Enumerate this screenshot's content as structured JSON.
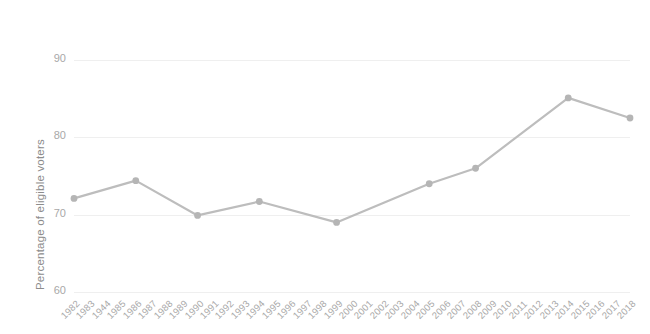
{
  "chart_data": {
    "type": "line",
    "title": "",
    "xlabel": "",
    "ylabel": "Percentage of eligible voters",
    "ylim": [
      60,
      90
    ],
    "yticks": [
      60,
      70,
      80,
      90
    ],
    "grid": true,
    "legend": false,
    "legend_position": "none",
    "line_color": "#bdbdbd",
    "marker_color": "#b5b5b5",
    "grid_color": "#efefef",
    "axis_label_color": "#a8a8a8",
    "categories": [
      "1982",
      "1983",
      "1944",
      "1985",
      "1986",
      "1987",
      "1988",
      "1989",
      "1990",
      "1991",
      "1992",
      "1993",
      "1994",
      "1995",
      "1996",
      "1997",
      "1998",
      "1999",
      "2000",
      "2001",
      "2002",
      "2003",
      "2004",
      "2005",
      "2006",
      "2007",
      "2008",
      "2009",
      "2010",
      "2011",
      "2012",
      "2013",
      "2014",
      "2015",
      "2016",
      "2017",
      "2018"
    ],
    "series": [
      {
        "name": "Percentage of eligible voters",
        "points": [
          {
            "x": "1982",
            "y": 72.1
          },
          {
            "x": "1986",
            "y": 74.4
          },
          {
            "x": "1990",
            "y": 69.9
          },
          {
            "x": "1994",
            "y": 71.7
          },
          {
            "x": "1999",
            "y": 69.0
          },
          {
            "x": "2005",
            "y": 74.0
          },
          {
            "x": "2008",
            "y": 76.0
          },
          {
            "x": "2014",
            "y": 85.1
          },
          {
            "x": "2018",
            "y": 82.5
          }
        ]
      }
    ]
  }
}
